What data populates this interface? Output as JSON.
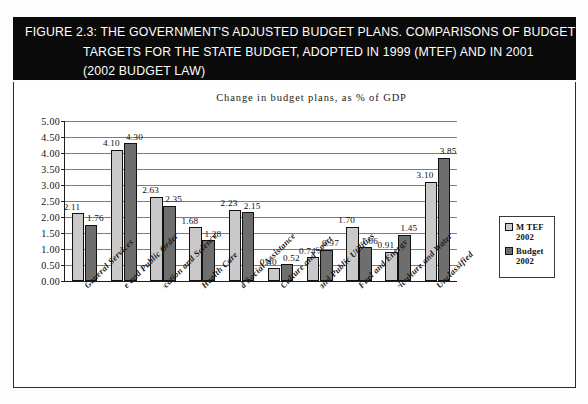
{
  "figure": {
    "caption_lines": [
      "FIGURE 2.3:   THE GOVERNMENT'S ADJUSTED BUDGET PLANS. COMPARISONS OF BUDGET",
      "TARGETS FOR THE STATE BUDGET, ADOPTED IN 1999 (MTEF) AND IN 2001",
      "(2002 BUDGET LAW)"
    ]
  },
  "colors": {
    "mtef": "#c9c9c9",
    "budget": "#6e6e6e",
    "banner": "#0a0a0a",
    "gridline": "#7c7c7c",
    "axis": "#1d1d1d"
  },
  "chart_data": {
    "type": "bar",
    "title": "Change in budget plans, as % of GDP",
    "xlabel": "",
    "ylabel": "",
    "ylim": [
      0,
      5
    ],
    "ytick_step": 0.5,
    "yticks": [
      "0.00",
      "0.50",
      "1.00",
      "1.50",
      "2.00",
      "2.50",
      "3.00",
      "3.50",
      "4.00",
      "4.50",
      "5.00"
    ],
    "grid": true,
    "legend_position": "right",
    "categories": [
      "General Services",
      "Defense and Public Order",
      "Education and Science",
      "Health Care",
      "Social Security and Social Assistance",
      "Culture and Sport",
      "Housing and Public Utilities",
      "Fuel and Energy",
      "Agriculture and Water",
      "Unclassified"
    ],
    "series": [
      {
        "name": "M TEF 2002",
        "values": [
          2.11,
          4.1,
          2.63,
          1.68,
          2.23,
          0.4,
          0.74,
          1.7,
          0.91,
          3.1
        ],
        "labels": [
          "2.11",
          "4.10",
          "2.63",
          "1.68",
          "2.23",
          "0.40",
          "0.74",
          "1.70",
          "0.91",
          "3.10"
        ]
      },
      {
        "name": "Budget 2002",
        "values": [
          1.76,
          4.3,
          2.35,
          1.28,
          2.15,
          0.52,
          0.97,
          1.06,
          1.45,
          3.85
        ],
        "labels": [
          "1.76",
          "4.30",
          "2.35",
          "1.28",
          "2.15",
          "0.52",
          "0.97",
          "1.06",
          "1.45",
          "3.85"
        ]
      }
    ]
  },
  "legend": {
    "items": [
      {
        "name": "M TEF",
        "year": "2002",
        "swatch": "mtef"
      },
      {
        "name": "Budget",
        "year": "2002",
        "swatch": "budget"
      }
    ]
  }
}
